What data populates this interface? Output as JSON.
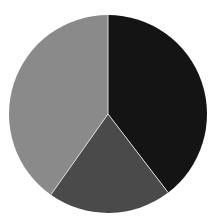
{
  "chart_data": {
    "type": "pie",
    "title": "",
    "categories": [
      "Slice A",
      "Slice B",
      "Slice C"
    ],
    "values": [
      39.6,
      20.2,
      40.2
    ],
    "unit": "%",
    "start_angle_deg": 0,
    "direction": "clockwise",
    "colors": [
      "#141414",
      "#4a4a4a",
      "#8a8a8a"
    ],
    "separator_color": "#d8d8d8",
    "legend": "none",
    "data_labels": "none",
    "geometry": {
      "cx": 108,
      "cy": 114,
      "r": 99
    }
  },
  "background": "#ffffff"
}
